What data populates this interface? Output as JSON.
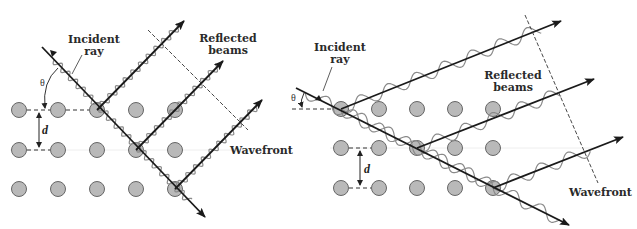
{
  "figure": {
    "colors": {
      "atom_fill": "#b9b9b9",
      "atom_stroke": "#666666",
      "ray": "#1a1a1a",
      "wave": "#8a8a8a",
      "dashed": "#333333"
    }
  },
  "left_panel": {
    "incident_label": "Incident\nray",
    "reflected_label": "Reflected\nbeams",
    "wavefront_label": "Wavefront",
    "theta_label": "θ",
    "spacing_label": "d",
    "atom_columns_x": [
      19,
      58,
      97,
      136,
      175
    ],
    "atom_rows_y": [
      110,
      150,
      189
    ]
  },
  "right_panel": {
    "incident_label": "Incident\nray",
    "reflected_label": "Reflected\nbeams",
    "wavefront_label": "Wavefront",
    "theta_label": "θ",
    "spacing_label": "d",
    "atom_columns_x": [
      341,
      379,
      417,
      455,
      493
    ],
    "atom_rows_y": [
      109,
      148,
      188
    ]
  }
}
